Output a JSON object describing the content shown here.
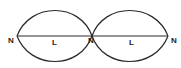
{
  "diagram": {
    "type": "standing-wave",
    "line_color": "#2a2a2a",
    "nodes": [
      {
        "label": "N",
        "x": 17,
        "y": 36
      },
      {
        "label": "N",
        "x": 92,
        "y": 36
      },
      {
        "label": "N",
        "x": 168,
        "y": 36
      }
    ],
    "loops": [
      {
        "label": "L"
      },
      {
        "label": "L"
      }
    ]
  }
}
